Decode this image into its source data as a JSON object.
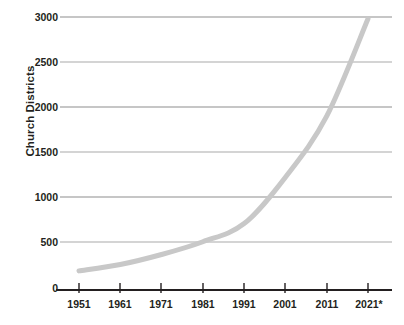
{
  "chart_data": {
    "type": "line",
    "title": "",
    "subtitle": "",
    "xlabel": "",
    "ylabel": "Church Districts",
    "x": [
      "1951",
      "1961",
      "1971",
      "1981",
      "1991",
      "2001",
      "2011",
      "2021*"
    ],
    "categories": [
      "1951",
      "1961",
      "1971",
      "1981",
      "1991",
      "2001",
      "2011",
      "2021*"
    ],
    "values": [
      210,
      280,
      390,
      530,
      730,
      1240,
      1910,
      2980
    ],
    "series": [
      {
        "name": "Church Districts",
        "values": [
          210,
          280,
          390,
          530,
          730,
          1240,
          1910,
          2980
        ]
      }
    ],
    "xlim": [
      1951,
      2021
    ],
    "ylim": [
      0,
      3000
    ],
    "y_ticks": [
      0,
      500,
      1000,
      1500,
      2000,
      2500,
      3000
    ],
    "y_tick_labels": [
      "0",
      "500",
      "1000",
      "1500",
      "2000",
      "2500",
      "3000"
    ],
    "x_tick_labels": [
      "1951",
      "1961",
      "1971",
      "1981",
      "1991",
      "2001",
      "2011",
      "2021*"
    ],
    "grid": "horizontal",
    "legend": "none",
    "annotations": [],
    "colors": {
      "line": "#c8c8c8",
      "grid": "#9a9a9a",
      "axis": "#231f20",
      "text": "#231f20",
      "background": "#ffffff"
    },
    "line_width": 5
  },
  "axis": {
    "y_title": "Church Districts"
  }
}
